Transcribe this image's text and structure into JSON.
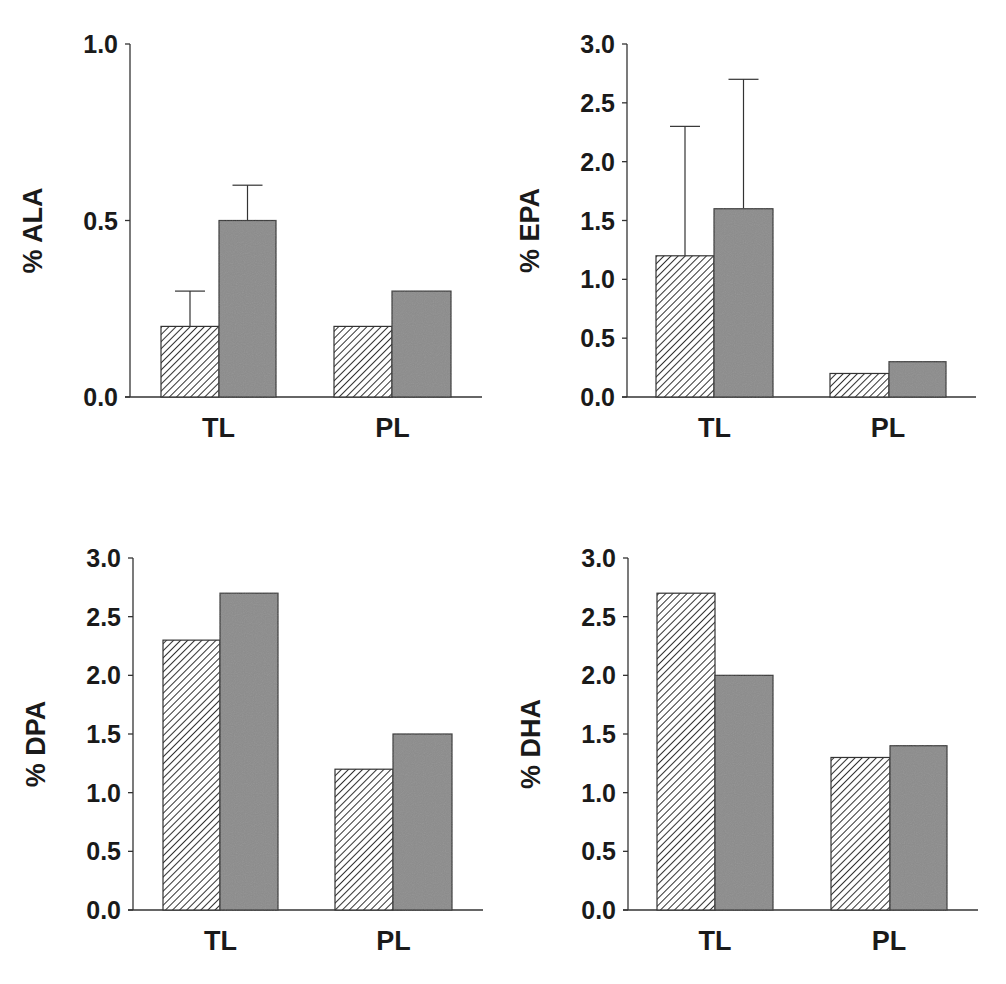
{
  "colors": {
    "hatch_fill": "#ffffff",
    "hatch_line": "#333333",
    "solid_fill": "#8c8c8c",
    "axis": "#333333",
    "text": "#1a1a1a"
  },
  "chart_data": [
    {
      "type": "bar",
      "title": "",
      "ylabel": "% ALA",
      "xlabel": "",
      "categories": [
        "TL",
        "PL"
      ],
      "ylim": [
        0,
        1.0
      ],
      "yticks": [
        "0.0",
        "0.5",
        "1.0"
      ],
      "grid": false,
      "series": [
        {
          "name": "hatched",
          "pattern": "diagonal-hatch",
          "values": [
            0.2,
            0.2
          ],
          "error_upper": [
            0.3,
            null
          ]
        },
        {
          "name": "gray",
          "pattern": "solid-gray",
          "values": [
            0.5,
            0.3
          ],
          "error_upper": [
            0.6,
            null
          ]
        }
      ]
    },
    {
      "type": "bar",
      "title": "",
      "ylabel": "% EPA",
      "xlabel": "",
      "categories": [
        "TL",
        "PL"
      ],
      "ylim": [
        0,
        3.0
      ],
      "yticks": [
        "0.0",
        "0.5",
        "1.0",
        "1.5",
        "2.0",
        "2.5",
        "3.0"
      ],
      "grid": false,
      "series": [
        {
          "name": "hatched",
          "pattern": "diagonal-hatch",
          "values": [
            1.2,
            0.2
          ],
          "error_upper": [
            2.3,
            null
          ]
        },
        {
          "name": "gray",
          "pattern": "solid-gray",
          "values": [
            1.6,
            0.3
          ],
          "error_upper": [
            2.7,
            null
          ]
        }
      ]
    },
    {
      "type": "bar",
      "title": "",
      "ylabel": "% DPA",
      "xlabel": "",
      "categories": [
        "TL",
        "PL"
      ],
      "ylim": [
        0,
        3.0
      ],
      "yticks": [
        "0.0",
        "0.5",
        "1.0",
        "1.5",
        "2.0",
        "2.5",
        "3.0"
      ],
      "grid": false,
      "series": [
        {
          "name": "hatched",
          "pattern": "diagonal-hatch",
          "values": [
            2.3,
            1.2
          ],
          "error_upper": [
            null,
            null
          ]
        },
        {
          "name": "gray",
          "pattern": "solid-gray",
          "values": [
            2.7,
            1.5
          ],
          "error_upper": [
            null,
            null
          ]
        }
      ]
    },
    {
      "type": "bar",
      "title": "",
      "ylabel": "% DHA",
      "xlabel": "",
      "categories": [
        "TL",
        "PL"
      ],
      "ylim": [
        0,
        3.0
      ],
      "yticks": [
        "0.0",
        "0.5",
        "1.0",
        "1.5",
        "2.0",
        "2.5",
        "3.0"
      ],
      "grid": false,
      "series": [
        {
          "name": "hatched",
          "pattern": "diagonal-hatch",
          "values": [
            2.7,
            1.3
          ],
          "error_upper": [
            null,
            null
          ]
        },
        {
          "name": "gray",
          "pattern": "solid-gray",
          "values": [
            2.0,
            1.4
          ],
          "error_upper": [
            null,
            null
          ]
        }
      ]
    }
  ]
}
